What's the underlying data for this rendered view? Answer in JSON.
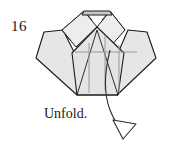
{
  "figure": {
    "step_number": "16",
    "caption": "Unfold.",
    "colors": {
      "paper_fill": "#e8e8e8",
      "paper_fill_light": "#f2f2f2",
      "paper_fill_shadow": "#d6d6d6",
      "outline": "#1a1a1a",
      "crease_line": "#9a9a9a",
      "background": "#ffffff"
    },
    "shapes": {
      "top_band": {
        "name": "top-edge-band",
        "points": "84,11 110,11 113,16 81,16"
      },
      "left_peak": {
        "name": "left-peak-facet",
        "points": "84,11 97,27 76,46 62,30"
      },
      "right_peak": {
        "name": "right-peak-facet",
        "points": "110,11 124,30 110,46 97,27"
      },
      "center_body": {
        "name": "center-body-panel",
        "points": "97,27 124,52 117,95 77,95 72,52"
      },
      "left_wing": {
        "name": "left-wing-flap",
        "points": "44,32 63,30 79,62 77,95 36,58"
      },
      "right_wing": {
        "name": "right-wing-flap",
        "points": "147,32 128,30 114,62 117,95 156,58"
      },
      "left_upper_strip": {
        "name": "left-upper-strip",
        "points": "62,30 84,11 90,18 70,39"
      },
      "right_upper_strip": {
        "name": "right-upper-strip",
        "points": "124,30 110,11 104,18 118,34"
      }
    },
    "crease_lines": [
      {
        "name": "crease-horizontal-center",
        "x1": 75,
        "y1": 52,
        "x2": 137,
        "y2": 52
      },
      {
        "name": "crease-vertical-left",
        "x1": 89,
        "y1": 43,
        "x2": 89,
        "y2": 93
      },
      {
        "name": "crease-vertical-center",
        "x1": 105,
        "y1": 35,
        "x2": 105,
        "y2": 90
      },
      {
        "name": "crease-vertical-right",
        "x1": 119,
        "y1": 45,
        "x2": 119,
        "y2": 93
      }
    ],
    "arrow": {
      "name": "unfold-arrow",
      "path": "M 110,52 C 106,72 104,92 111,112 C 115,122 119,127 123,131",
      "head": "118,118 135,123 124,138"
    }
  }
}
